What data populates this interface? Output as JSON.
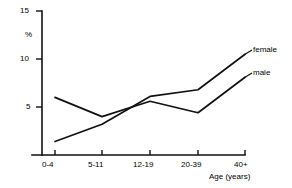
{
  "chart_data": {
    "type": "line",
    "title": "",
    "subtitle": "",
    "xlabel": "Age (years)",
    "ylabel": "%",
    "categories": [
      "0-4",
      "5-11",
      "12-19",
      "20-39",
      "40+"
    ],
    "series": [
      {
        "name": "male",
        "values": [
          6.0,
          4.0,
          5.6,
          4.4,
          8.1
        ]
      },
      {
        "name": "female",
        "values": [
          1.4,
          3.2,
          6.1,
          6.8,
          10.5
        ]
      }
    ],
    "ylim": [
      0,
      15
    ],
    "yticks": [
      5,
      10,
      15
    ],
    "ytick_labels": [
      "5",
      "10",
      "15"
    ],
    "xtick_labels": [
      "0-4",
      "5-11",
      "12-19",
      "20-39",
      "40+"
    ],
    "grid": false,
    "legend_position": "inline-right-end",
    "annotations": [
      {
        "text": "female",
        "attached_to": "female",
        "at_category": "40+"
      },
      {
        "text": "male",
        "attached_to": "male",
        "at_category": "40+"
      }
    ],
    "line_color": "#111111",
    "background_color": "#ffffff"
  }
}
